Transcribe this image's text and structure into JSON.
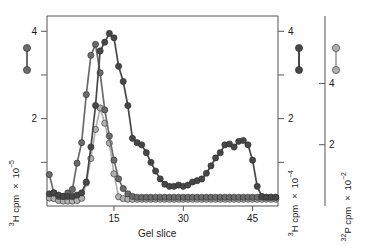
{
  "chart_data": {
    "type": "line",
    "title": "",
    "xlabel": "Gel slice",
    "axes": {
      "x": {
        "min": 0.5,
        "max": 50.5,
        "ticks": [
          15,
          30,
          45
        ],
        "tick_labels": [
          "15",
          "30",
          "45"
        ]
      },
      "y_left": {
        "label_parts": {
          "sup_pre": "3",
          "mid": "H cpm × 10",
          "sup_post": "−5"
        },
        "label": "3H cpm × 10−5",
        "min": 0,
        "max": 4.35,
        "ticks": [
          1,
          2,
          3,
          4
        ],
        "tick_labels": [
          "",
          "2",
          "",
          "4"
        ]
      },
      "y_right_inner": {
        "label_parts": {
          "sup_pre": "3",
          "mid": "H cpm × 10",
          "sup_post": "−4"
        },
        "label": "3H cpm × 10−4",
        "min": 0,
        "max": 4.35,
        "ticks": [
          1,
          2,
          3,
          4
        ],
        "tick_labels": [
          "",
          "2",
          "",
          "4"
        ]
      },
      "y_right_outer": {
        "label_parts": {
          "sup_pre": "32",
          "mid": "P cpm × 10",
          "sup_post": "−2"
        },
        "label": "32P cpm × 10−2",
        "min": 0,
        "max": 6.2,
        "ticks": [
          2,
          4
        ],
        "tick_labels": [
          "2",
          "4"
        ]
      }
    },
    "grid": false,
    "legend_position": "left-and-right-margins",
    "series": [
      {
        "name": "3H cpm x 10-5",
        "legend_marker": "dumbbell",
        "color": "#6b6b6b",
        "axis": "y_left",
        "x": [
          1,
          2,
          3,
          4,
          5,
          6,
          7,
          8,
          9,
          10,
          11,
          12,
          13,
          14,
          15,
          16,
          17,
          18,
          19,
          20,
          21,
          22,
          23,
          24,
          25,
          26,
          27,
          28,
          29,
          30,
          31,
          32,
          33,
          34,
          35,
          36,
          37,
          38,
          39,
          40,
          41,
          42,
          43,
          44,
          45,
          46,
          47,
          48,
          49,
          50
        ],
        "y": [
          0.72,
          0.3,
          0.22,
          0.22,
          0.3,
          0.38,
          0.98,
          1.45,
          2.55,
          3.45,
          3.7,
          3.05,
          2.2,
          1.6,
          1.05,
          0.62,
          0.4,
          0.28,
          0.22,
          0.2,
          0.2,
          0.2,
          0.2,
          0.2,
          0.2,
          0.2,
          0.2,
          0.2,
          0.2,
          0.2,
          0.2,
          0.2,
          0.2,
          0.2,
          0.2,
          0.2,
          0.2,
          0.2,
          0.2,
          0.2,
          0.2,
          0.2,
          0.2,
          0.2,
          0.2,
          0.2,
          0.2,
          0.2,
          0.2,
          0.2
        ]
      },
      {
        "name": "3H cpm x 10-4",
        "legend_marker": "dumbbell",
        "color": "#474747",
        "axis": "y_right_inner",
        "x": [
          1,
          2,
          3,
          4,
          5,
          6,
          7,
          8,
          9,
          10,
          11,
          12,
          13,
          14,
          15,
          16,
          17,
          18,
          19,
          20,
          21,
          22,
          23,
          24,
          25,
          26,
          27,
          28,
          29,
          30,
          31,
          32,
          33,
          34,
          35,
          36,
          37,
          38,
          39,
          40,
          41,
          42,
          43,
          44,
          45,
          46,
          47,
          48,
          49,
          50
        ],
        "y": [
          0.28,
          0.3,
          0.25,
          0.22,
          0.22,
          0.22,
          0.25,
          0.3,
          0.55,
          1.35,
          2.3,
          3.55,
          3.75,
          3.95,
          3.85,
          3.2,
          2.85,
          2.3,
          1.55,
          1.45,
          1.4,
          1.22,
          1.0,
          0.8,
          0.62,
          0.5,
          0.45,
          0.45,
          0.48,
          0.45,
          0.48,
          0.55,
          0.58,
          0.62,
          0.75,
          0.92,
          1.1,
          1.22,
          1.4,
          1.42,
          1.35,
          1.48,
          1.5,
          1.4,
          1.05,
          0.45,
          0.22,
          0.2,
          0.2,
          0.2
        ]
      },
      {
        "name": "32P cpm x 10-2",
        "legend_marker": "dumbbell",
        "color": "#b0b0b0",
        "axis": "y_right_outer",
        "x": [
          1,
          2,
          3,
          4,
          5,
          6,
          7,
          8,
          9,
          10,
          11,
          12,
          13,
          14,
          15,
          16,
          17,
          18,
          19,
          20,
          21,
          22,
          23,
          24,
          25,
          26,
          27,
          28,
          29,
          30,
          31,
          32,
          33,
          34,
          35,
          36,
          37,
          38,
          39,
          40,
          41,
          42,
          43,
          44,
          45,
          46,
          47,
          48,
          49,
          50
        ],
        "y": [
          0.26,
          0.24,
          0.18,
          0.16,
          0.16,
          0.16,
          0.18,
          0.25,
          0.75,
          1.55,
          2.5,
          3.2,
          2.7,
          2.05,
          1.05,
          0.3,
          0.24,
          0.22,
          0.22,
          0.22,
          0.22,
          0.22,
          0.22,
          0.22,
          0.22,
          0.22,
          0.22,
          0.22,
          0.22,
          0.22,
          0.22,
          0.22,
          0.22,
          0.22,
          0.22,
          0.22,
          0.22,
          0.22,
          0.22,
          0.22,
          0.22,
          0.22,
          0.22,
          0.22,
          0.22,
          0.22,
          0.22,
          0.22,
          0.22,
          0.22
        ]
      }
    ]
  },
  "legends": {
    "left": {
      "name": "3H-10-5-legend",
      "color": "#6b6b6b"
    },
    "right_inner": {
      "name": "3H-10-4-legend",
      "color": "#474747"
    },
    "right_outer": {
      "name": "32P-10-2-legend",
      "color": "#b0b0b0"
    }
  },
  "colors": {
    "axis": "#555555",
    "series_1": "#6b6b6b",
    "series_2": "#474747",
    "series_3": "#b0b0b0",
    "text": "#1a1a1a",
    "background": "#ffffff"
  }
}
